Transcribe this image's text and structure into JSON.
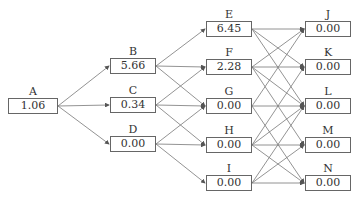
{
  "header": {
    "text": "·· ··· ··"
  },
  "nodes": {
    "A": {
      "label": "A",
      "value": "1.06"
    },
    "B": {
      "label": "B",
      "value": "5.66"
    },
    "C": {
      "label": "C",
      "value": "0.34"
    },
    "D": {
      "label": "D",
      "value": "0.00"
    },
    "E": {
      "label": "E",
      "value": "6.45"
    },
    "F": {
      "label": "F",
      "value": "2.28"
    },
    "G": {
      "label": "G",
      "value": "0.00"
    },
    "H": {
      "label": "H",
      "value": "0.00"
    },
    "I": {
      "label": "I",
      "value": "0.00"
    },
    "J": {
      "label": "J",
      "value": "0.00"
    },
    "K": {
      "label": "K",
      "value": "0.00"
    },
    "L": {
      "label": "L",
      "value": "0.00"
    },
    "M": {
      "label": "M",
      "value": "0.00"
    },
    "N": {
      "label": "N",
      "value": "0.00"
    }
  },
  "edges": [
    [
      "A",
      "B"
    ],
    [
      "A",
      "C"
    ],
    [
      "A",
      "D"
    ],
    [
      "B",
      "E"
    ],
    [
      "B",
      "F"
    ],
    [
      "B",
      "G"
    ],
    [
      "C",
      "F"
    ],
    [
      "C",
      "G"
    ],
    [
      "C",
      "H"
    ],
    [
      "D",
      "G"
    ],
    [
      "D",
      "H"
    ],
    [
      "D",
      "I"
    ],
    [
      "E",
      "J"
    ],
    [
      "E",
      "K"
    ],
    [
      "E",
      "L"
    ],
    [
      "F",
      "J"
    ],
    [
      "F",
      "K"
    ],
    [
      "F",
      "L"
    ],
    [
      "F",
      "M"
    ],
    [
      "G",
      "J"
    ],
    [
      "G",
      "L"
    ],
    [
      "G",
      "N"
    ],
    [
      "H",
      "K"
    ],
    [
      "H",
      "L"
    ],
    [
      "H",
      "M"
    ],
    [
      "H",
      "N"
    ],
    [
      "I",
      "L"
    ],
    [
      "I",
      "M"
    ],
    [
      "I",
      "N"
    ]
  ]
}
